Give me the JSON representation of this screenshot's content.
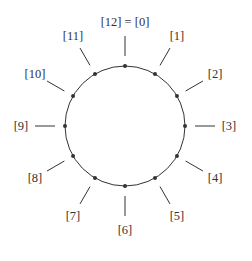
{
  "diagram": {
    "center": [
      125,
      126
    ],
    "radius": 60,
    "colors": {
      "stroke": "#333333",
      "text": "#333333",
      "background": "#ffffff"
    },
    "labels": [
      {
        "index": 0,
        "text": "[12] = [0]"
      },
      {
        "index": 1,
        "text": "[1]"
      },
      {
        "index": 2,
        "text": "[2]"
      },
      {
        "index": 3,
        "text": "[3]"
      },
      {
        "index": 4,
        "text": "[4]"
      },
      {
        "index": 5,
        "text": "[5]"
      },
      {
        "index": 6,
        "text": "[6]"
      },
      {
        "index": 7,
        "text": "[7]"
      },
      {
        "index": 8,
        "text": "[8]"
      },
      {
        "index": 9,
        "text": "[9]"
      },
      {
        "index": 10,
        "text": "[10]"
      },
      {
        "index": 11,
        "text": "[11]"
      }
    ]
  }
}
